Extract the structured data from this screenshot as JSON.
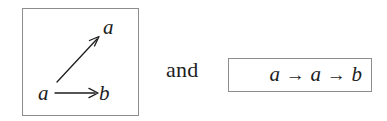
{
  "figure": {
    "background_color": "#ffffff",
    "ink_color": "#1d1d1d",
    "border_color": "#8d8d8d",
    "conjunction_label": "and"
  },
  "graph_panel": {
    "caption": "",
    "nodes": [
      {
        "id": "a-source",
        "label": "a",
        "position": "bottom-left"
      },
      {
        "id": "b-target",
        "label": "b",
        "position": "bottom-right"
      },
      {
        "id": "a-target",
        "label": "a",
        "position": "top-right"
      }
    ],
    "edges": [
      {
        "from": "a-source",
        "to": "b-target",
        "style": "straight-arrow",
        "direction": "horizontal"
      },
      {
        "from": "a-source",
        "to": "a-target",
        "style": "straight-arrow",
        "direction": "diagonal-up-right"
      }
    ]
  },
  "sequence_panel": {
    "terms": [
      "a",
      "a",
      "b"
    ],
    "separator": "→",
    "full_text": "a → a → b"
  }
}
